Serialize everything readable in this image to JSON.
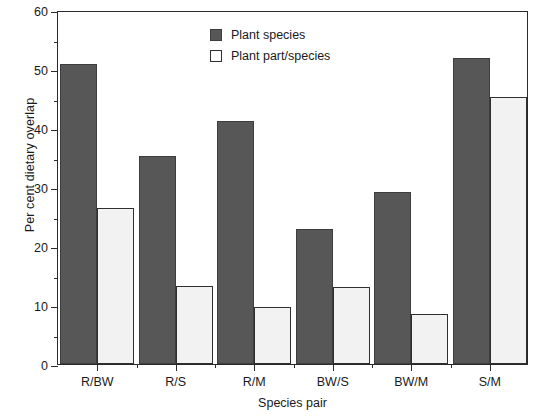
{
  "chart_data": {
    "type": "bar",
    "title": "",
    "xlabel": "Species pair",
    "ylabel": "Per cent dietary overlap",
    "categories": [
      "R/BW",
      "R/S",
      "R/M",
      "BW/S",
      "BW/M",
      "S/M"
    ],
    "series": [
      {
        "name": "Plant species",
        "color": "#575757",
        "values": [
          50.8,
          35.3,
          41.2,
          22.8,
          29.2,
          51.9
        ]
      },
      {
        "name": "Plant part/species",
        "color": "#f2f2f2",
        "values": [
          26.4,
          13.2,
          9.6,
          13.1,
          8.4,
          45.3
        ]
      }
    ],
    "ylim": [
      0,
      60
    ],
    "ytick_labels": [
      "0",
      "10",
      "20",
      "30",
      "40",
      "50",
      "60"
    ],
    "ytick_values": [
      0,
      10,
      20,
      30,
      40,
      50,
      60
    ],
    "yminor_values": [
      5,
      15,
      25,
      35,
      45,
      55
    ],
    "grid": "off",
    "legend_position": "top-center"
  },
  "legend": {
    "entries": [
      {
        "label": "Plant species",
        "swatch": "dark-filled-square"
      },
      {
        "label": "Plant part/species",
        "swatch": "open-square"
      }
    ]
  }
}
